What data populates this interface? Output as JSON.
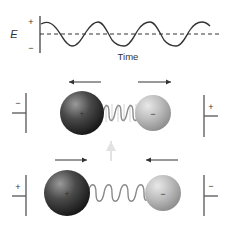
{
  "graph": {
    "y_axis_label": "E",
    "plus_label": "+",
    "minus_label": "−",
    "x_axis_label": "Time"
  },
  "molecule_top": {
    "left_plate_sign": "−",
    "right_plate_sign": "+",
    "large_atom_charge": "+",
    "small_atom_charge": "−",
    "arrows": "outward (stretch)"
  },
  "molecule_bottom": {
    "left_plate_sign": "+",
    "right_plate_sign": "−",
    "large_atom_charge": "+",
    "small_atom_charge": "−",
    "arrows": "inward (compress)"
  },
  "colors": {
    "line": "#333333",
    "large_atom": "#3a3a3a",
    "small_atom": "#b5b5b5",
    "spring": "#8a8a8a"
  }
}
